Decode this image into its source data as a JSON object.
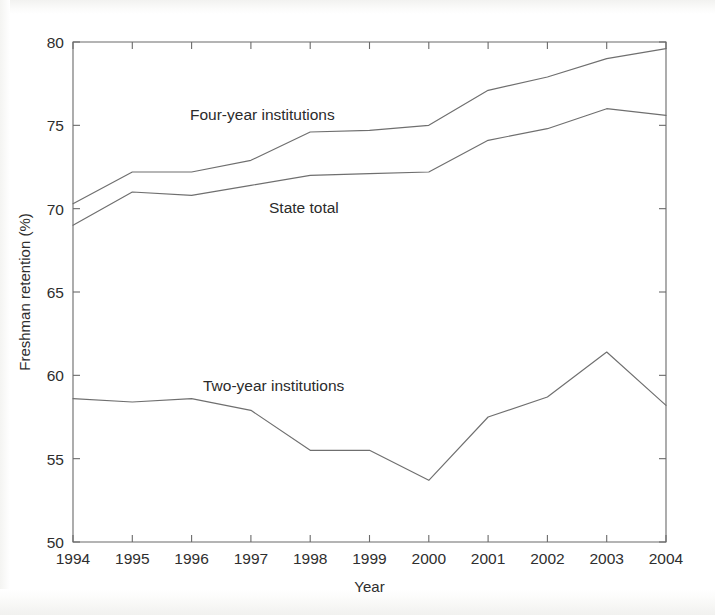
{
  "chart_data": {
    "type": "line",
    "title": "",
    "xlabel": "Year",
    "ylabel": "Freshman retention (%)",
    "x": [
      1994,
      1995,
      1996,
      1997,
      1998,
      1999,
      2000,
      2001,
      2002,
      2003,
      2004
    ],
    "xticklabels": [
      "1994",
      "1995",
      "1996",
      "1997",
      "1998",
      "1999",
      "2000",
      "2001",
      "2002",
      "2003",
      "2004"
    ],
    "yticklabels": [
      "50",
      "55",
      "60",
      "65",
      "70",
      "75",
      "80"
    ],
    "yticks": [
      50,
      55,
      60,
      65,
      70,
      75,
      80
    ],
    "xlim": [
      1994,
      2004
    ],
    "ylim": [
      50,
      80
    ],
    "grid": false,
    "legend_position": "inline-annotations",
    "series": [
      {
        "name": "Four-year institutions",
        "label_text": "Four-year institutions",
        "color": "#6f6f6f",
        "values": [
          70.3,
          72.2,
          72.2,
          72.9,
          74.6,
          74.7,
          75.0,
          77.1,
          77.9,
          79.0,
          79.6
        ]
      },
      {
        "name": "State total",
        "label_text": "State total",
        "color": "#6f6f6f",
        "values": [
          69.0,
          71.0,
          70.8,
          71.4,
          72.0,
          72.1,
          72.2,
          74.1,
          74.8,
          76.0,
          75.6
        ]
      },
      {
        "name": "Two-year institutions",
        "label_text": "Two-year institutions",
        "color": "#6f6f6f",
        "values": [
          58.6,
          58.4,
          58.6,
          57.9,
          55.5,
          55.5,
          53.7,
          57.5,
          58.7,
          61.4,
          58.2
        ]
      }
    ],
    "annotations": [
      {
        "text": "Four-year institutions",
        "x_px": 190,
        "y_px": 120
      },
      {
        "text": "State total",
        "x_px": 269,
        "y_px": 213
      },
      {
        "text": "Two-year institutions",
        "x_px": 203,
        "y_px": 391
      }
    ]
  }
}
